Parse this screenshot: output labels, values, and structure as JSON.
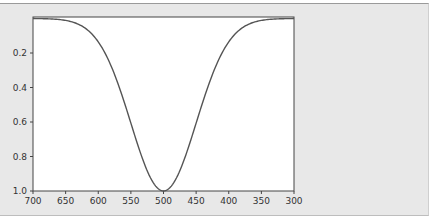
{
  "chart_data": {
    "type": "line",
    "title": "",
    "xlabel": "",
    "ylabel": "",
    "xlim": [
      700,
      300
    ],
    "ylim": [
      1.0,
      0.0
    ],
    "x_ticks": [
      "700",
      "650",
      "600",
      "550",
      "500",
      "450",
      "400",
      "350",
      "300"
    ],
    "y_ticks": [
      "0.2",
      "0.4",
      "0.6",
      "0.8",
      "1.0"
    ],
    "grid": false,
    "legend": null,
    "series": [
      {
        "name": "gaussian",
        "shape": "gaussian",
        "center": 500,
        "sigma": 50,
        "amplitude": 1.0,
        "x": [
          700,
          650,
          600,
          575,
          550,
          525,
          510,
          500,
          490,
          475,
          450,
          425,
          400,
          350,
          300
        ],
        "values": [
          0.0,
          0.0,
          0.135,
          0.325,
          0.607,
          0.882,
          0.98,
          1.0,
          0.98,
          0.882,
          0.607,
          0.325,
          0.135,
          0.011,
          0.0
        ],
        "color": "#555555"
      }
    ]
  },
  "colors": {
    "panel_bg": "#e8e8e8",
    "plot_bg": "#ffffff",
    "axis": "#444444",
    "line": "#555555"
  }
}
